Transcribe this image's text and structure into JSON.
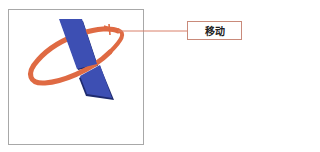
{
  "callout": {
    "label": "移动",
    "line_color": "#d9806a"
  },
  "logo": {
    "bar_color": "#3d4fb3",
    "bar_shadow": "#1e2a6e",
    "ring_color": "#df6a43"
  }
}
